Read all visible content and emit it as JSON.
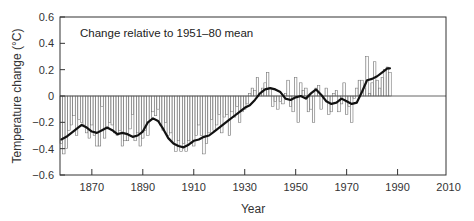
{
  "chart_data": {
    "type": "bar",
    "title": "",
    "annotation": "Change relative to 1951–80 mean",
    "xlabel": "Year",
    "ylabel": "Temperature change (°C)",
    "xlim": [
      1857.5,
      2009
    ],
    "ylim": [
      -0.6,
      0.6
    ],
    "xticks": [
      1870,
      1890,
      1910,
      1930,
      1950,
      1970,
      1990,
      2010
    ],
    "yticks": [
      -0.6,
      -0.4,
      -0.2,
      0,
      0.2,
      0.4,
      0.6
    ],
    "ytick_labels": [
      "−0.6",
      "−0.4",
      "−0.2",
      "0",
      "0.2",
      "0.4",
      "0.6"
    ],
    "grid": false,
    "legend": null,
    "series": [
      {
        "name": "Annual temperature anomaly",
        "kind": "bar",
        "x_start": 1858,
        "values": [
          -0.36,
          -0.44,
          -0.4,
          -0.26,
          -0.22,
          -0.15,
          -0.3,
          -0.18,
          -0.2,
          -0.22,
          -0.28,
          -0.32,
          -0.22,
          -0.3,
          -0.38,
          -0.38,
          -0.08,
          -0.32,
          -0.25,
          -0.2,
          -0.22,
          -0.28,
          -0.3,
          -0.26,
          -0.38,
          -0.34,
          -0.34,
          -0.25,
          -0.14,
          -0.34,
          -0.28,
          -0.38,
          -0.32,
          -0.26,
          -0.3,
          -0.18,
          -0.12,
          -0.15,
          -0.1,
          -0.22,
          -0.26,
          -0.2,
          -0.3,
          -0.28,
          -0.35,
          -0.42,
          -0.34,
          -0.42,
          -0.36,
          -0.42,
          -0.34,
          -0.36,
          -0.38,
          -0.3,
          -0.22,
          -0.3,
          -0.44,
          -0.36,
          -0.28,
          -0.18,
          -0.26,
          -0.22,
          -0.14,
          -0.28,
          -0.16,
          -0.14,
          -0.3,
          -0.12,
          -0.16,
          -0.08,
          -0.2,
          -0.12,
          -0.1,
          -0.06,
          0.02,
          0.06,
          0.04,
          0.14,
          0.02,
          0.06,
          0.1,
          0.18,
          0.06,
          -0.08,
          -0.04,
          -0.1,
          -0.04,
          -0.06,
          0.02,
          0.12,
          -0.08,
          -0.12,
          0.14,
          -0.2,
          0.1,
          0.04,
          0.06,
          -0.12,
          -0.1,
          -0.2,
          0.06,
          0.08,
          -0.1,
          0.0,
          0.06,
          -0.14,
          -0.12,
          0.02,
          0.04,
          -0.12,
          -0.06,
          0.1,
          -0.14,
          -0.08,
          -0.2,
          -0.02,
          0.06,
          0.12,
          0.12,
          0.06,
          0.3,
          0.02,
          0.1,
          0.26,
          0.12,
          0.06,
          0.14,
          0.2,
          0.22,
          0.18
        ],
        "years_note": "values indexed from 1858 (annual)"
      },
      {
        "name": "Smoothed mean",
        "kind": "line",
        "x": [
          1858,
          1860,
          1862,
          1864,
          1866,
          1868,
          1870,
          1872,
          1874,
          1876,
          1878,
          1880,
          1882,
          1884,
          1886,
          1888,
          1890,
          1892,
          1894,
          1896,
          1898,
          1900,
          1902,
          1904,
          1906,
          1908,
          1910,
          1912,
          1914,
          1916,
          1918,
          1920,
          1922,
          1924,
          1926,
          1928,
          1930,
          1932,
          1934,
          1936,
          1938,
          1940,
          1942,
          1944,
          1946,
          1948,
          1950,
          1952,
          1954,
          1956,
          1958,
          1960,
          1962,
          1964,
          1966,
          1968,
          1970,
          1972,
          1974,
          1976,
          1978,
          1980,
          1982,
          1984,
          1986,
          1987
        ],
        "values": [
          -0.33,
          -0.31,
          -0.28,
          -0.25,
          -0.22,
          -0.24,
          -0.27,
          -0.28,
          -0.26,
          -0.24,
          -0.26,
          -0.29,
          -0.28,
          -0.29,
          -0.31,
          -0.3,
          -0.27,
          -0.2,
          -0.17,
          -0.19,
          -0.25,
          -0.32,
          -0.36,
          -0.38,
          -0.39,
          -0.37,
          -0.34,
          -0.33,
          -0.31,
          -0.3,
          -0.27,
          -0.24,
          -0.21,
          -0.18,
          -0.15,
          -0.12,
          -0.09,
          -0.07,
          -0.03,
          0.02,
          0.05,
          0.06,
          0.05,
          0.03,
          -0.02,
          -0.03,
          -0.01,
          0.0,
          -0.02,
          0.02,
          0.05,
          0.01,
          -0.04,
          -0.06,
          -0.05,
          -0.02,
          -0.04,
          -0.06,
          -0.05,
          0.03,
          0.12,
          0.13,
          0.15,
          0.18,
          0.21,
          0.21
        ]
      }
    ]
  }
}
